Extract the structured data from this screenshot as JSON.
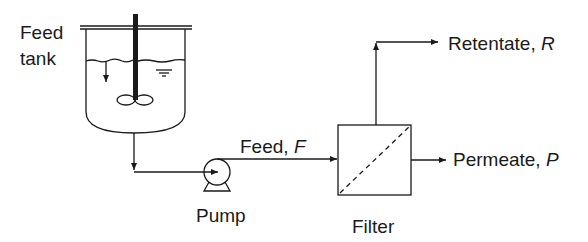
{
  "diagram": {
    "labels": {
      "feed_tank_line1": "Feed",
      "feed_tank_line2": "tank",
      "feed_stream": "Feed, ",
      "feed_symbol": "F",
      "pump": "Pump",
      "filter": "Filter",
      "retentate": "Retentate, ",
      "retentate_symbol": "R",
      "permeate": "Permeate, ",
      "permeate_symbol": "P"
    },
    "components": [
      {
        "id": "feed-tank",
        "type": "stirred-tank"
      },
      {
        "id": "pump",
        "type": "centrifugal-pump"
      },
      {
        "id": "filter",
        "type": "membrane-filter"
      }
    ],
    "streams": [
      {
        "from": "feed-tank",
        "to": "pump"
      },
      {
        "from": "pump",
        "to": "filter",
        "label": "Feed, F"
      },
      {
        "from": "filter",
        "to": "out",
        "label": "Retentate, R"
      },
      {
        "from": "filter",
        "to": "out",
        "label": "Permeate, P"
      }
    ],
    "colors": {
      "line": "#1a1a1a",
      "background": "#ffffff"
    }
  }
}
